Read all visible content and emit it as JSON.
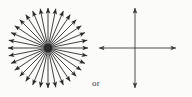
{
  "figure": {
    "width": 192,
    "height": 97,
    "background_color": "#fbfbfa",
    "stroke_color": "#2b2b2b",
    "connector_label": "or"
  },
  "chart_data": {
    "type": "diagram",
    "title": "",
    "subtitle": "",
    "xlabel": "",
    "ylabel": "",
    "panels": [
      {
        "name": "radial-burst",
        "kind": "radial-arrow-burst",
        "center": [
          48,
          48
        ],
        "radius": 40,
        "ray_count": 32,
        "angle_step_degrees": 11.25,
        "start_angle_degrees": 0,
        "arrowhead": "outward",
        "center_dot_radius": 4.2,
        "stroke_color": "#2b2b2b",
        "stroke_width": 0.9
      },
      {
        "name": "cross-arrows",
        "kind": "double-headed-cross",
        "center": [
          135,
          48
        ],
        "arm_lengths": {
          "up": 40,
          "down": 40,
          "left": 36,
          "right": 41
        },
        "arrow_count": 4,
        "arrowhead": "outward",
        "stroke_color": "#3a3a3a",
        "stroke_width": 0.9,
        "arms": [
          {
            "name": "up-arrow",
            "angle_degrees": 90,
            "tip": [
              135,
              8
            ]
          },
          {
            "name": "down-arrow",
            "angle_degrees": 270,
            "tip": [
              135,
              88
            ]
          },
          {
            "name": "left-arrow",
            "angle_degrees": 180,
            "tip": [
              99,
              48
            ]
          },
          {
            "name": "right-arrow",
            "angle_degrees": 0,
            "tip": [
              176,
              48
            ]
          }
        ]
      }
    ],
    "annotations": [
      {
        "name": "or-label",
        "text": "or",
        "position": [
          92,
          79
        ]
      }
    ]
  }
}
